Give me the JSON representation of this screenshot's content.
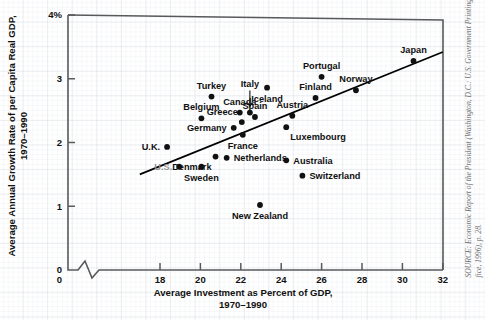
{
  "chart_data": {
    "type": "scatter",
    "title": "",
    "xlabel": "Average Investment as Percent of GDP,\n1970–1990",
    "xlabel_line1": "Average Investment as Percent of GDP,",
    "xlabel_line2": "1970–1990",
    "ylabel": "Average Annual Growth Rate of per Capita Real GDP,\n1970–1990",
    "ylabel_line1": "Average Annual Growth Rate of per Capita Real GDP,",
    "ylabel_line2": "1970–1990",
    "xlim": [
      16.8,
      32
    ],
    "ylim": [
      0,
      4
    ],
    "xticks": [
      18,
      20,
      22,
      24,
      26,
      28,
      30,
      32
    ],
    "xticklabels": [
      "18",
      "20",
      "22",
      "24",
      "26",
      "28",
      "30",
      "32"
    ],
    "yticks": [
      0,
      1,
      2,
      3,
      4
    ],
    "yticklabels": [
      "0",
      "1",
      "2",
      "3",
      "4%"
    ],
    "x_axis_break": true,
    "y_axis_break": false,
    "grid": "graph-paper-background",
    "legend": "none",
    "points": [
      {
        "label": "U.K.",
        "x": 18.35,
        "y": 1.93,
        "label_pos": "left",
        "muted": false
      },
      {
        "label": "U.S.",
        "x": 18.95,
        "y": 1.62,
        "label_pos": "left",
        "muted": true
      },
      {
        "label": "Belgium",
        "x": 20.05,
        "y": 2.38,
        "label_pos": "above",
        "muted": false
      },
      {
        "label": "Turkey",
        "x": 20.55,
        "y": 2.72,
        "label_pos": "above",
        "muted": false
      },
      {
        "label": "Denmark",
        "x": 20.75,
        "y": 1.78,
        "label_pos": "below-left",
        "muted": false
      },
      {
        "label": "Sweden",
        "x": 20.05,
        "y": 1.62,
        "label_pos": "below",
        "muted": false
      },
      {
        "label": "Germany",
        "x": 21.65,
        "y": 2.23,
        "label_pos": "left",
        "muted": false
      },
      {
        "label": "Netherlands",
        "x": 21.3,
        "y": 1.76,
        "label_pos": "right",
        "muted": false
      },
      {
        "label": "Greece",
        "x": 22.05,
        "y": 2.32,
        "label_pos": "above-left",
        "muted": false
      },
      {
        "label": "Canada",
        "x": 21.95,
        "y": 2.47,
        "label_pos": "above",
        "muted": false
      },
      {
        "label": "France",
        "x": 22.1,
        "y": 2.12,
        "label_pos": "below",
        "muted": false
      },
      {
        "label": "Italy",
        "x": 22.45,
        "y": 2.47,
        "label_pos": "leader-up",
        "muted": false
      },
      {
        "label": "Spain",
        "x": 22.7,
        "y": 2.4,
        "label_pos": "above",
        "muted": false
      },
      {
        "label": "New Zealand",
        "x": 22.95,
        "y": 1.02,
        "label_pos": "below",
        "muted": false
      },
      {
        "label": "Iceland",
        "x": 23.3,
        "y": 2.86,
        "label_pos": "below",
        "muted": false
      },
      {
        "label": "Australia",
        "x": 24.25,
        "y": 1.72,
        "label_pos": "right",
        "muted": false
      },
      {
        "label": "Austria",
        "x": 24.55,
        "y": 2.42,
        "label_pos": "above",
        "muted": false
      },
      {
        "label": "Luxembourg",
        "x": 24.25,
        "y": 2.24,
        "label_pos": "below-right",
        "muted": false
      },
      {
        "label": "Switzerland",
        "x": 25.05,
        "y": 1.48,
        "label_pos": "right",
        "muted": false
      },
      {
        "label": "Finland",
        "x": 25.7,
        "y": 2.7,
        "label_pos": "above",
        "muted": false
      },
      {
        "label": "Portugal",
        "x": 26.0,
        "y": 3.03,
        "label_pos": "above",
        "muted": false
      },
      {
        "label": "Norway",
        "x": 27.7,
        "y": 2.82,
        "label_pos": "above",
        "muted": false
      },
      {
        "label": "Japan",
        "x": 30.55,
        "y": 3.28,
        "label_pos": "above",
        "muted": false
      }
    ],
    "trendline": {
      "x0": 17.0,
      "y0": 1.5,
      "x1": 32.0,
      "y1": 3.42,
      "style": "solid-black"
    }
  },
  "source": {
    "line1": "SOURCE: Economic Report of the President (Washington, D.C.: U.S. Government Printing Of-",
    "line2": "fice, 1996), p. 28."
  }
}
